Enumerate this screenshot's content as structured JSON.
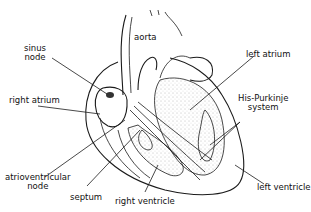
{
  "diagram": {
    "labels": {
      "aorta": "aorta",
      "sinus_node_line1": "sinus",
      "sinus_node_line2": "node",
      "right_atrium": "right atrium",
      "left_atrium": "left atrium",
      "his_purkinje_line1": "His-Purkinje",
      "his_purkinje_line2": "system",
      "av_node_line1": "atrioventricular",
      "av_node_line2": "node",
      "septum": "septum",
      "right_ventricle": "right ventricle",
      "left_ventricle": "left ventricle"
    },
    "colors": {
      "ink": "#1a1a1a",
      "background": "#ffffff",
      "stipple": "#777777"
    }
  }
}
